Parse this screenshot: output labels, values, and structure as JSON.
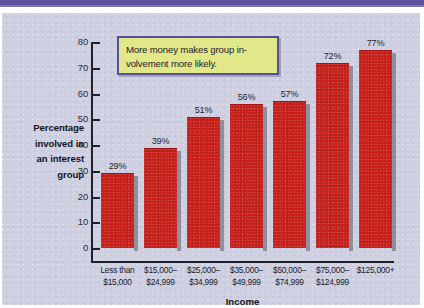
{
  "figure": {
    "callout_text": "More money makes group in-volvement more likely.",
    "background_color": "#ced0e2",
    "accent_color": "#5b519b",
    "bar_color": "#c8211c",
    "callout_fill": "#e2e88a",
    "callout_border": "#56509a"
  },
  "chart_data": {
    "type": "bar",
    "title": "",
    "xlabel": "Income",
    "ylabel": "Percentage involved in an interest group",
    "ylabel_lines": [
      "Percentage",
      "involved in",
      "an interest",
      "group"
    ],
    "categories": [
      "Less than $15,000",
      "$15,000–$24,999",
      "$25,000–$34,999",
      "$35,000–$49,999",
      "$50,000–$74,999",
      "$75,000–$124,999",
      "$125,000+"
    ],
    "category_lines": [
      [
        "Less than",
        "$15,000"
      ],
      [
        "$15,000–",
        "$24,999"
      ],
      [
        "$25,000–",
        "$34,999"
      ],
      [
        "$35,000–",
        "$49,999"
      ],
      [
        "$50,000–",
        "$74,999"
      ],
      [
        "$75,000–",
        "$124,999"
      ],
      [
        "$125,000+",
        ""
      ]
    ],
    "values": [
      29,
      39,
      51,
      56,
      57,
      72,
      77
    ],
    "value_labels": [
      "29%",
      "39%",
      "51%",
      "56%",
      "57%",
      "72%",
      "77%"
    ],
    "ylim": [
      0,
      80
    ],
    "yticks": [
      0,
      10,
      20,
      30,
      40,
      50,
      60,
      70,
      80
    ],
    "ytick_labels": [
      "0",
      "10",
      "20",
      "30",
      "40",
      "50",
      "60",
      "70",
      "80"
    ],
    "grid": false,
    "legend": null
  }
}
